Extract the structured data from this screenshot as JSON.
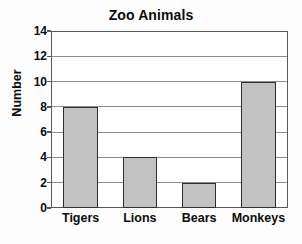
{
  "chart_data": {
    "type": "bar",
    "title": "Zoo Animals",
    "xlabel": "",
    "ylabel": "Number",
    "categories": [
      "Tigers",
      "Lions",
      "Bears",
      "Monkeys"
    ],
    "values": [
      8,
      4,
      2,
      10
    ],
    "ylim": [
      0,
      14
    ],
    "ytick_step": 2,
    "yticks": [
      0,
      2,
      4,
      6,
      8,
      10,
      12,
      14
    ],
    "ytick_labels": [
      "0",
      "2",
      "4",
      "6",
      "8",
      "10",
      "12",
      "14"
    ],
    "grid": true,
    "grid_axis": "y",
    "legend": false,
    "legend_position": "none",
    "bar_fill_color": "#c2c2c2",
    "bar_edge_color": "#2e2e2e",
    "gridline_color": "#8f8f8f",
    "axis_color": "#5a5a5a",
    "background_color": "#ffffff",
    "text_color": "#0c0c0c"
  }
}
